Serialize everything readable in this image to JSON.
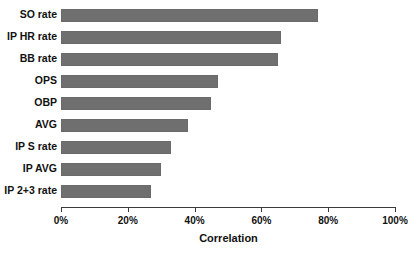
{
  "chart_data": {
    "type": "bar",
    "orientation": "horizontal",
    "title": "",
    "xlabel": "Correlation",
    "ylabel": "",
    "categories": [
      "SO rate",
      "IP HR rate",
      "BB rate",
      "OPS",
      "OBP",
      "AVG",
      "IP S rate",
      "IP AVG",
      "IP 2+3 rate"
    ],
    "values": [
      77,
      66,
      65,
      47,
      45,
      38,
      33,
      30,
      27
    ],
    "value_unit": "%",
    "xlim": [
      0,
      100
    ],
    "xticks": [
      0,
      20,
      40,
      60,
      80,
      100
    ],
    "xtick_labels": [
      "0%",
      "20%",
      "40%",
      "60%",
      "80%",
      "100%"
    ],
    "grid": false,
    "legend": false,
    "bar_color": "#6f6f6f",
    "axis_color": "#3a3a3a",
    "background": "#ffffff"
  }
}
